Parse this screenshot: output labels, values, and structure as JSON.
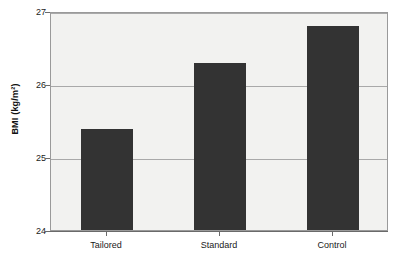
{
  "chart_data": {
    "type": "bar",
    "title": "",
    "subtitle": "",
    "xlabel": "",
    "ylabel": "BMI (kg/m²)",
    "categories": [
      "Tailored",
      "Standard",
      "Control"
    ],
    "values": [
      25.39,
      26.29,
      26.79
    ],
    "series": [
      {
        "name": "BMI",
        "values": [
          25.39,
          26.29,
          26.79
        ]
      }
    ],
    "ylim": [
      24,
      27
    ],
    "yticks": [
      24,
      25,
      26,
      27
    ],
    "ytick_labels": [
      "24",
      "25",
      "26",
      "27"
    ],
    "grid": true,
    "grid_axis": "y",
    "legend": false,
    "legend_position": "none",
    "bar_color": "#333333",
    "plot_background": "#f2f2f0",
    "figure_background": "#ffffff",
    "gridline_color": "#a9a9a9",
    "axis_color": "#6a6a6a",
    "annotations": []
  },
  "axes": {
    "y": {
      "title": "BMI (kg/m²)",
      "ticks": [
        {
          "label": "27",
          "value": 27
        },
        {
          "label": "26",
          "value": 26
        },
        {
          "label": "25",
          "value": 25
        },
        {
          "label": "24",
          "value": 24
        }
      ]
    },
    "x": {
      "title": "",
      "ticks": [
        {
          "label": "Tailored"
        },
        {
          "label": "Standard"
        },
        {
          "label": "Control"
        }
      ]
    }
  }
}
